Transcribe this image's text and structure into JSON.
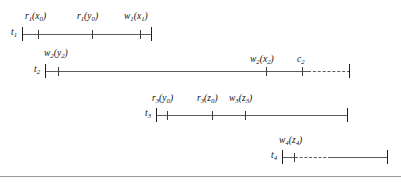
{
  "figure": {
    "kind": "transaction-timeline-diagram",
    "width": 401,
    "height": 183,
    "line_color": "#5c5c5c",
    "cap_color": "#1e1e1e",
    "baseline_color": "#9a9a9a"
  },
  "rows": [
    {
      "name": "t",
      "name_sub": "1",
      "axis": {
        "x": 22,
        "y": 34,
        "length": 130
      },
      "start_cap": {
        "x": 22,
        "y": 27,
        "height": 14
      },
      "end_cap": {
        "x": 151,
        "y": 27,
        "height": 14
      },
      "dashed_from": null,
      "events": [
        {
          "label": "r",
          "label_sub": "1",
          "arg": "(x",
          "arg_sub": "0",
          "arg_end": ")",
          "text": "r1(x0)",
          "tick_x": 38,
          "label_x": 25,
          "label_y": 12
        },
        {
          "label": "r",
          "label_sub": "1",
          "arg": "(y",
          "arg_sub": "0",
          "arg_end": ")",
          "text": "r1(y0)",
          "tick_x": 92,
          "label_x": 77,
          "label_y": 12
        },
        {
          "label": "w",
          "label_sub": "1",
          "arg": "(x",
          "arg_sub": "1",
          "arg_end": ")",
          "text": "w1(x1)",
          "tick_x": 140,
          "label_x": 124,
          "label_y": 12
        }
      ]
    },
    {
      "name": "t",
      "name_sub": "2",
      "axis": {
        "x": 45,
        "y": 71,
        "length": 263
      },
      "start_cap": {
        "x": 45,
        "y": 64,
        "height": 14
      },
      "end_cap": {
        "x": 349,
        "y": 64,
        "height": 14
      },
      "dashed_from": {
        "x": 308,
        "length": 42
      },
      "events": [
        {
          "label": "w",
          "label_sub": "2",
          "arg": "(y",
          "arg_sub": "2",
          "arg_end": ")",
          "text": "w2(y2)",
          "tick_x": 58,
          "label_x": 44,
          "label_y": 49
        },
        {
          "label": "w",
          "label_sub": "2",
          "arg": "(x",
          "arg_sub": "2",
          "arg_end": ")",
          "text": "w2(x2)",
          "tick_x": 266,
          "label_x": 250,
          "label_y": 55
        },
        {
          "label": "c",
          "label_sub": "2",
          "arg": "",
          "arg_sub": "",
          "arg_end": "",
          "text": "c2",
          "tick_x": 302,
          "label_x": 297,
          "label_y": 55
        }
      ]
    },
    {
      "name": "t",
      "name_sub": "3",
      "axis": {
        "x": 156,
        "y": 115,
        "length": 192
      },
      "start_cap": {
        "x": 156,
        "y": 108,
        "height": 14
      },
      "end_cap": {
        "x": 347,
        "y": 108,
        "height": 14
      },
      "dashed_from": null,
      "events": [
        {
          "label": "r",
          "label_sub": "3",
          "arg": "(y",
          "arg_sub": "0",
          "arg_end": ")",
          "text": "r3(y0)",
          "tick_x": 167,
          "label_x": 152,
          "label_y": 94
        },
        {
          "label": "r",
          "label_sub": "3",
          "arg": "(z",
          "arg_sub": "0",
          "arg_end": ")",
          "text": "r3(z0)",
          "tick_x": 212,
          "label_x": 197,
          "label_y": 94
        },
        {
          "label": "w",
          "label_sub": "3",
          "arg": "(z",
          "arg_sub": "3",
          "arg_end": ")",
          "text": "w3(z3)",
          "tick_x": 245,
          "label_x": 229,
          "label_y": 94
        }
      ]
    },
    {
      "name": "t",
      "name_sub": "4",
      "axis": {
        "x": 282,
        "y": 157,
        "length": 106
      },
      "start_cap": {
        "x": 282,
        "y": 150,
        "height": 14
      },
      "end_cap": {
        "x": 387,
        "y": 150,
        "height": 14
      },
      "dashed_from": {
        "x": 295,
        "length": 36
      },
      "events": [
        {
          "label": "w",
          "label_sub": "4",
          "arg": "(z",
          "arg_sub": "4",
          "arg_end": ")",
          "text": "w4(z4)",
          "tick_x": 294,
          "label_x": 279,
          "label_y": 136
        }
      ]
    }
  ],
  "baseline": {
    "y": 176
  }
}
